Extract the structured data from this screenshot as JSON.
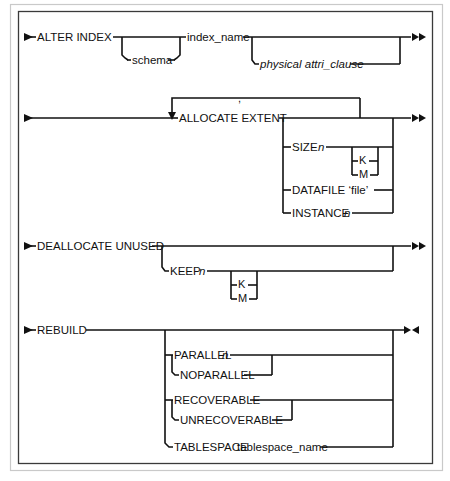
{
  "diagram": {
    "kind": "railroad-syntax-diagram",
    "title": "ALTER INDEX",
    "ink_color": "#111111",
    "background_color": "#ffffff",
    "frame_color": "#3a3a3a",
    "lines": [
      {
        "id": "alter-index",
        "start_marker": "single-arrow",
        "end_marker": "double-arrow",
        "main": [
          "ALTER INDEX",
          "index_name"
        ],
        "optional_below": [
          "schema",
          "physical attri_clause"
        ]
      },
      {
        "id": "allocate-extent",
        "start_marker": "single-arrow",
        "end_marker": "double-arrow",
        "main": [
          "ALLOCATE EXTENT"
        ],
        "loop_label": ",",
        "options": [
          "SIZE n",
          "DATAFILE 'file'",
          "INSTANCE n"
        ],
        "units": [
          "K",
          "M"
        ]
      },
      {
        "id": "deallocate-unused",
        "start_marker": "single-arrow",
        "end_marker": "double-arrow",
        "main": [
          "DEALLOCATE UNUSED"
        ],
        "options": [
          "KEEP n"
        ],
        "units": [
          "K",
          "M"
        ]
      },
      {
        "id": "rebuild",
        "start_marker": "single-arrow",
        "end_marker": "terminator",
        "main": [
          "REBUILD"
        ],
        "option_groups": [
          [
            "PARALLEL n",
            "NOPARALLEL"
          ],
          [
            "RECOVERABLE",
            "UNRECOVERABLE"
          ],
          [
            "TABLESPACE  tablespace_name"
          ]
        ]
      }
    ]
  },
  "labels": {
    "alter_index": "ALTER INDEX",
    "schema": "schema",
    "index_name": "index_name",
    "physical_attri_clause": "physical attri_clause",
    "allocate_extent": "ALLOCATE EXTENT",
    "comma": ",",
    "size_n_word": "SIZE",
    "size_n_var": "n",
    "k_unit_1": "K",
    "m_unit_1": "M",
    "datafile": "DATAFILE ‘file’",
    "instance_word": "INSTANCE",
    "instance_var": "n",
    "deallocate_unused": "DEALLOCATE UNUSED",
    "keep_word": "KEEP",
    "keep_var": "n",
    "k_unit_2": "K",
    "m_unit_2": "M",
    "rebuild": "REBUILD",
    "parallel_word": "PARALLEL",
    "parallel_var": "n",
    "noparallel": "NOPARALLEL",
    "recoverable": "RECOVERABLE",
    "unrecoverable": "UNRECOVERABLE",
    "tablespace_word": "TABLESPACE",
    "tablespace_name": "tablespace_name"
  }
}
